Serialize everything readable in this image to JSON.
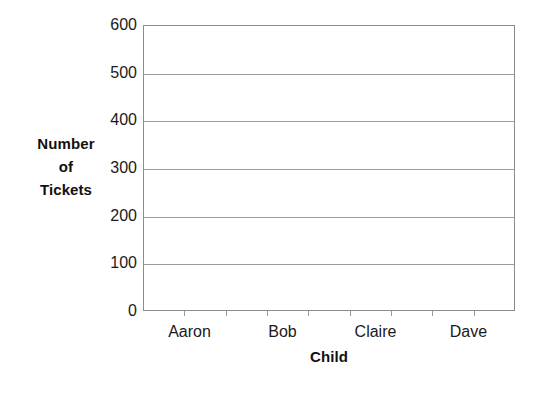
{
  "chart_data": {
    "type": "bar",
    "title": "",
    "subtitle": "",
    "xlabel": "Child",
    "ylabel": "Number of Tickets",
    "ylabel_lines": [
      "Number",
      "of",
      "Tickets"
    ],
    "categories": [
      "Aaron",
      "Bob",
      "Claire",
      "Dave"
    ],
    "values": [
      null,
      null,
      null,
      null
    ],
    "series": [
      {
        "name": "Number of Tickets",
        "values": [
          null,
          null,
          null,
          null
        ]
      }
    ],
    "ylim": [
      0,
      600
    ],
    "ytick_step": 100,
    "ytick_labels": [
      "600",
      "500",
      "400",
      "300",
      "200",
      "100",
      "0"
    ],
    "ytick_values": [
      600,
      500,
      400,
      300,
      200,
      100,
      0
    ],
    "xtick_count": 8,
    "grid": true,
    "grid_axis": "y",
    "legend": false,
    "legend_position": "none",
    "annotations": [],
    "note": "Empty plot grid — no bars drawn for any category",
    "colors": {
      "background": "#ffffff",
      "frame": "#8c8c8c",
      "gridline": "#9a9a9a",
      "text": "#1a1a1a",
      "axis_title": "#111111"
    }
  }
}
